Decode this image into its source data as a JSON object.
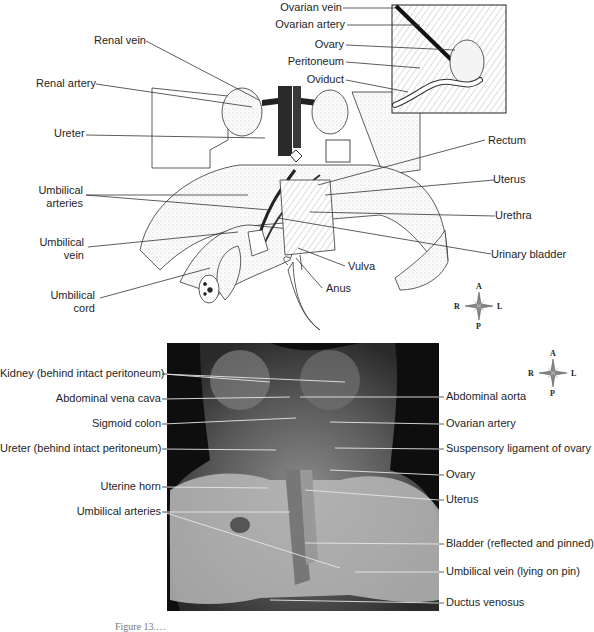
{
  "top_diagram": {
    "labels_left": {
      "renal_vein": "Renal vein",
      "renal_artery": "Renal artery",
      "ureter": "Ureter",
      "umbilical_arteries": [
        "Umbilical",
        "arteries"
      ],
      "umbilical_vein": [
        "Umbilical",
        "vein"
      ],
      "umbilical_cord": [
        "Umbilical",
        "cord"
      ]
    },
    "inset_labels": {
      "ovarian_vein": "Ovarian vein",
      "ovarian_artery": "Ovarian artery",
      "ovary": "Ovary",
      "peritoneum": "Peritoneum",
      "oviduct": "Oviduct"
    },
    "labels_right": {
      "rectum": "Rectum",
      "uterus": "Uterus",
      "urethra": "Urethra",
      "urinary_bladder": "Urinary bladder",
      "vulva": "Vulva",
      "anus": "Anus"
    },
    "compass": {
      "a": "A",
      "p": "P",
      "r": "R",
      "l": "L"
    }
  },
  "bottom_photo": {
    "labels_left": {
      "kidney": "Kidney (behind intact peritoneum)",
      "abdominal_vena_cava": "Abdominal vena cava",
      "sigmoid_colon": "Sigmoid colon",
      "ureter": "Ureter (behind intact peritoneum)",
      "uterine_horn": "Uterine horn",
      "umbilical_arteries": "Umbilical arteries"
    },
    "labels_right": {
      "abdominal_aorta": "Abdominal aorta",
      "ovarian_artery": "Ovarian artery",
      "suspensory_ligament": "Suspensory ligament of ovary",
      "ovary": "Ovary",
      "uterus": "Uterus",
      "bladder": "Bladder (reflected and pinned)",
      "umbilical_vein": "Umbilical vein (lying on pin)",
      "ductus_venosus": "Ductus venosus"
    },
    "compass": {
      "a": "A",
      "p": "P",
      "r": "R",
      "l": "L"
    }
  },
  "caption": "Figure 13.…"
}
